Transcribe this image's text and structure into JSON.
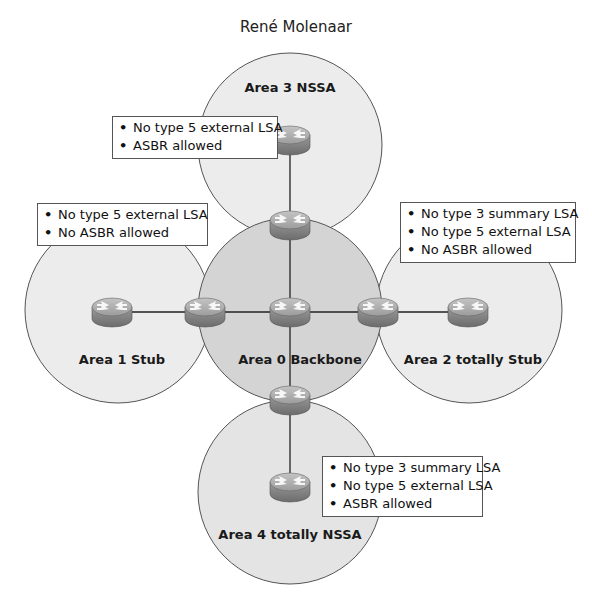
{
  "author": "René Molenaar",
  "colors": {
    "area_fill": "#e8e8e8",
    "backbone_fill": "#d2d2d2",
    "circle_stroke": "#555555",
    "router_body": "#8a8a8a",
    "router_top": "#b5b5b5",
    "link": "#222222"
  },
  "areas": [
    {
      "id": "area0",
      "label": "Area 0 Backbone"
    },
    {
      "id": "area1",
      "label": "Area 1 Stub"
    },
    {
      "id": "area2",
      "label": "Area 2 totally Stub"
    },
    {
      "id": "area3",
      "label": "Area 3 NSSA"
    },
    {
      "id": "area4",
      "label": "Area 4 totally NSSA"
    }
  ],
  "notes": {
    "area3": [
      "No type 5 external LSA",
      "ASBR allowed"
    ],
    "area1": [
      "No type 5 external LSA",
      "No ASBR allowed"
    ],
    "area2": [
      "No type 3 summary LSA",
      "No type 5 external LSA",
      "No ASBR allowed"
    ],
    "area4": [
      "No type 3 summary LSA",
      "No type 5 external LSA",
      "ASBR allowed"
    ]
  },
  "routers": [
    {
      "name": "router-area3-internal"
    },
    {
      "name": "router-abr-area3"
    },
    {
      "name": "router-area1-internal"
    },
    {
      "name": "router-abr-area1"
    },
    {
      "name": "router-backbone-core"
    },
    {
      "name": "router-abr-area2"
    },
    {
      "name": "router-area2-internal"
    },
    {
      "name": "router-abr-area4"
    },
    {
      "name": "router-area4-internal"
    }
  ]
}
